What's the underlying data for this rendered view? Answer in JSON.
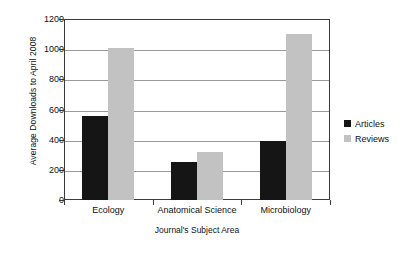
{
  "chart_data": {
    "type": "bar",
    "title": "",
    "xlabel": "Journal's Subject Area",
    "ylabel": "Average Downloads to April 2008",
    "categories": [
      "Ecology",
      "Anatomical Science",
      "Microbiology"
    ],
    "series": [
      {
        "name": "Articles",
        "color": "#151515",
        "values": [
          560,
          250,
          390
        ]
      },
      {
        "name": "Reviews",
        "color": "#c2c2c2",
        "values": [
          1010,
          320,
          1100
        ]
      }
    ],
    "ylim": [
      0,
      1200
    ],
    "ytick_step": 200,
    "yticks": [
      0,
      200,
      400,
      600,
      800,
      1000,
      1200
    ],
    "ytick_labels": [
      "0",
      "200",
      "400",
      "600",
      "800",
      "1000",
      "1200"
    ],
    "grid": "horizontal",
    "legend_position": "right-outside",
    "legend_entries": [
      "Articles",
      "Reviews"
    ],
    "background_color": "#ffffff",
    "axis_color": "#3a3a3a",
    "gridline_color": "#9a9a9a"
  }
}
